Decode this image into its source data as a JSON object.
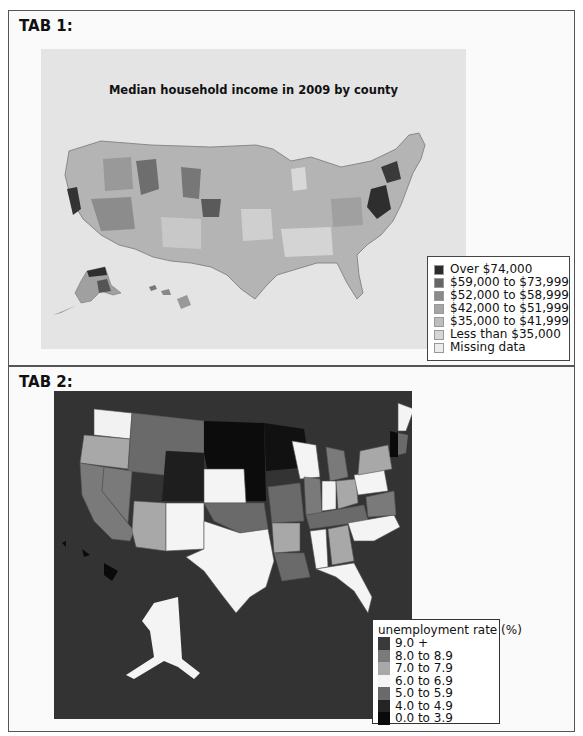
{
  "tabs": [
    {
      "label": "TAB 1:",
      "map_title": "Median household income in 2009 by county",
      "legend": {
        "items": [
          {
            "label": "Over $74,000",
            "color": "#2b2b2b"
          },
          {
            "label": "$59,000 to $73,999",
            "color": "#666666"
          },
          {
            "label": "$52,000 to $58,999",
            "color": "#8a8a8a"
          },
          {
            "label": "$42,000 to $51,999",
            "color": "#a6a6a6"
          },
          {
            "label": "$35,000 to $41,999",
            "color": "#bdbdbd"
          },
          {
            "label": "Less than $35,000",
            "color": "#d6d6d6"
          },
          {
            "label": "Missing data",
            "color": "#ececec"
          }
        ]
      }
    },
    {
      "label": "TAB 2:",
      "legend": {
        "title": "unemployment rate (%)",
        "items": [
          {
            "label": "9.0 +",
            "color": "#3a3a3a"
          },
          {
            "label": "8.0 to 8.9",
            "color": "#7a7a7a"
          },
          {
            "label": "7.0 to 7.9",
            "color": "#a8a8a8"
          },
          {
            "label": "6.0 to 6.9",
            "color": "#f4f4f4"
          },
          {
            "label": "5.0 to 5.9",
            "color": "#6a6a6a"
          },
          {
            "label": "4.0 to 4.9",
            "color": "#242424"
          },
          {
            "label": "0.0 to 3.9",
            "color": "#0a0a0a"
          }
        ]
      }
    }
  ]
}
